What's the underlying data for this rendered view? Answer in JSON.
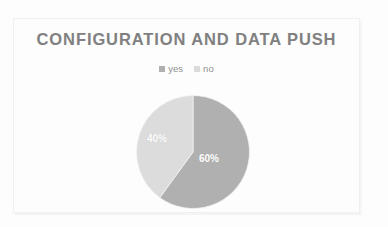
{
  "slide": {
    "title": "CONFIGURATION AND DATA PUSH",
    "background_color": "#fdfdfd",
    "title_color": "#808080",
    "frame_color": "#f0f0f0"
  },
  "legend": {
    "position": "top",
    "items": [
      {
        "label": "yes",
        "color": "#b0b0b0",
        "marker": "square-marker"
      },
      {
        "label": "no",
        "color": "#dcdcdc",
        "marker": "square-marker"
      }
    ]
  },
  "labels": {
    "yes_value": "60%",
    "no_value": "40%"
  },
  "chart_data": {
    "type": "pie",
    "title": "CONFIGURATION AND DATA PUSH",
    "xlabel": "",
    "ylabel": "",
    "grid": false,
    "legend_position": "top",
    "start_angle_deg": 0,
    "direction": "clockwise",
    "categories": [
      "yes",
      "no"
    ],
    "values": [
      60,
      40
    ],
    "value_labels": [
      "60%",
      "40%"
    ],
    "colors": [
      "#b0b0b0",
      "#dcdcdc"
    ],
    "label_text_color": "#ffffff",
    "slices": [
      {
        "name": "yes",
        "percent": 60,
        "label": "60%",
        "color": "#b0b0b0"
      },
      {
        "name": "no",
        "percent": 40,
        "label": "40%",
        "color": "#dcdcdc"
      }
    ]
  }
}
